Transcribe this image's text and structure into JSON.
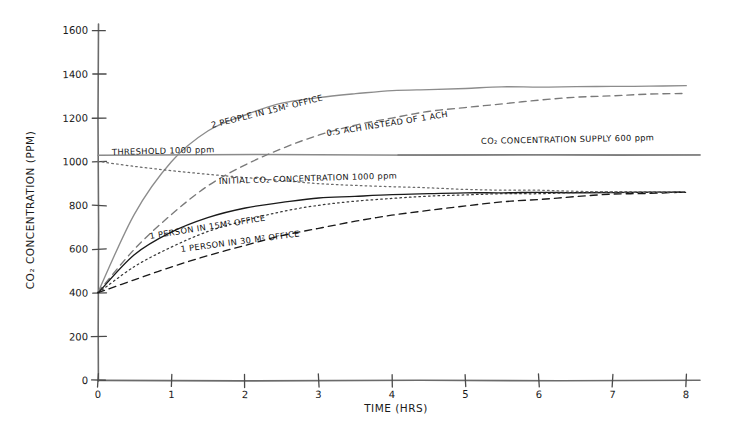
{
  "chart_data": {
    "type": "line",
    "title": "",
    "xlabel": "TIME (HRS)",
    "ylabel": "CO2 CONCENTRATION (PPM)",
    "xlim": [
      0,
      8
    ],
    "ylim": [
      0,
      1600
    ],
    "xticks": [
      "0",
      "1",
      "2",
      "3",
      "4",
      "5",
      "6",
      "7",
      "8"
    ],
    "yticks": [
      "0",
      "200",
      "400",
      "600",
      "800",
      "1000",
      "1200",
      "1400",
      "1600"
    ],
    "grid": false,
    "legend": "inline-curve-labels",
    "style": "hand-drawn sketch",
    "x": [
      0,
      0.5,
      1,
      1.5,
      2,
      2.5,
      3,
      3.5,
      4,
      4.5,
      5,
      5.5,
      6,
      6.5,
      7,
      7.5,
      8
    ],
    "series": [
      {
        "name": "2 PEOPLE IN 15m² OFFICE",
        "label": "2 PEOPLE IN 15M² OFFICE",
        "linestyle": "solid",
        "color": "#8c8c8c",
        "values": [
          400,
          760,
          1000,
          1140,
          1215,
          1265,
          1292,
          1310,
          1322,
          1330,
          1335,
          1339,
          1342,
          1344,
          1345,
          1346,
          1347
        ]
      },
      {
        "name": "0.5 ACH INSTEAD OF 1 ACH",
        "label": "0.5 ACH INSTEAD OF 1 ACH",
        "linestyle": "dashed",
        "color": "#7a7a7a",
        "values": [
          400,
          600,
          760,
          890,
          985,
          1060,
          1120,
          1165,
          1200,
          1228,
          1248,
          1265,
          1280,
          1292,
          1300,
          1306,
          1312
        ]
      },
      {
        "name": "1 PERSON IN 15m² OFFICE",
        "label": "1 PERSON IN 15M² OFFICE",
        "linestyle": "solid",
        "color": "#1a1a1a",
        "values": [
          400,
          575,
          680,
          745,
          788,
          815,
          832,
          843,
          850,
          854,
          857,
          858,
          859,
          860,
          860,
          860,
          861
        ]
      },
      {
        "name": "1 PERSON IN 15m² OFFICE (dotted variant)",
        "label": "",
        "linestyle": "dotted",
        "color": "#3a3a3a",
        "values": [
          400,
          520,
          612,
          682,
          733,
          771,
          799,
          818,
          832,
          841,
          848,
          852,
          855,
          857,
          859,
          860,
          861
        ]
      },
      {
        "name": "1 PERSON IN 30m² OFFICE",
        "label": "1 PERSON IN 30 M² OFFICE",
        "linestyle": "dashed",
        "color": "#1a1a1a",
        "values": [
          400,
          462,
          520,
          572,
          618,
          660,
          696,
          727,
          754,
          778,
          798,
          815,
          829,
          840,
          849,
          856,
          861
        ]
      },
      {
        "name": "INITIAL CO2 CONCENTRATION 1000 ppm",
        "label": "INITIAL CO₂ CONCENTRATION   1000 ppm",
        "linestyle": "dotted",
        "color": "#6b6b6b",
        "values": [
          1000,
          978,
          958,
          940,
          925,
          912,
          901,
          892,
          885,
          879,
          874,
          870,
          867,
          865,
          863,
          862,
          861
        ]
      }
    ],
    "reference_lines": [
      {
        "name": "threshold",
        "label": "THRESHOLD 1000 ppm",
        "value": 1000,
        "linestyle": "solid",
        "color": "#6b6b6b"
      },
      {
        "name": "co2-concentration-supply",
        "label": "CO₂ CONCENTRATION SUPPLY 600 ppm",
        "value": 1000,
        "linestyle": "solid",
        "color": "#6b6b6b"
      }
    ],
    "annotations": [
      "2 PEOPLE IN 15M² OFFICE",
      "0.5 ACH INSTEAD OF 1 ACH",
      "CO₂ CONCENTRATION SUPPLY 600 ppm",
      "THRESHOLD 1000 ppm",
      "INITIAL CO₂ CONCENTRATION   1000 ppm",
      "1 PERSON IN 15M² OFFICE",
      "1 PERSON IN 30 M² OFFICE"
    ]
  },
  "axes": {
    "x_title": "TIME (HRS)",
    "y_title": "CO₂ CONCENTRATION (PPM)",
    "x_ticks": [
      "0",
      "1",
      "2",
      "3",
      "4",
      "5",
      "6",
      "7",
      "8"
    ],
    "y_ticks": [
      "0",
      "200",
      "400",
      "600",
      "800",
      "1000",
      "1200",
      "1400",
      "1600"
    ]
  },
  "labels": {
    "two_people": "2 PEOPLE IN 15M² OFFICE",
    "half_ach": "0.5 ACH INSTEAD OF 1 ACH",
    "supply": "CO₂ CONCENTRATION SUPPLY 600 ppm",
    "threshold": "THRESHOLD 1000 ppm",
    "initial": "INITIAL CO₂ CONCENTRATION   1000 ppm",
    "one_person_15": "1 PERSON IN 15M² OFFICE",
    "one_person_30": "1 PERSON IN 30 M² OFFICE"
  },
  "colors": {
    "ink": "#1a1a1a",
    "gray": "#6b6b6b",
    "light_gray": "#8c8c8c",
    "background": "#ffffff"
  }
}
